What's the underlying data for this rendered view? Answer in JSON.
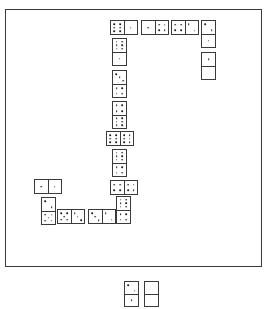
{
  "scene": {
    "title": "Domino chain layout",
    "board": {
      "x": 5,
      "y": 9,
      "width": 257,
      "height": 258
    }
  },
  "chart_data": {
    "type": "diagram",
    "tile_count_in_play": 16,
    "tile_count_off_board": 2,
    "board_tiles": [
      {
        "id": "t1",
        "values": [
          6,
          1
        ],
        "orientation": "horizontal",
        "x": 110,
        "y": 20,
        "w": 28,
        "h": 15
      },
      {
        "id": "t2",
        "values": [
          1,
          4
        ],
        "orientation": "horizontal",
        "x": 141,
        "y": 20,
        "w": 28,
        "h": 15
      },
      {
        "id": "t3",
        "values": [
          4,
          2
        ],
        "orientation": "horizontal",
        "x": 171,
        "y": 20,
        "w": 28,
        "h": 15
      },
      {
        "id": "t4",
        "values": [
          2,
          1
        ],
        "orientation": "vertical",
        "x": 201,
        "y": 20,
        "w": 15,
        "h": 28
      },
      {
        "id": "t5",
        "values": [
          1,
          0
        ],
        "orientation": "vertical",
        "x": 201,
        "y": 52,
        "w": 15,
        "h": 28
      },
      {
        "id": "t6",
        "values": [
          6,
          1
        ],
        "orientation": "vertical",
        "x": 112,
        "y": 38,
        "w": 15,
        "h": 28
      },
      {
        "id": "t7",
        "values": [
          3,
          4
        ],
        "orientation": "vertical",
        "x": 112,
        "y": 70,
        "w": 15,
        "h": 28
      },
      {
        "id": "t8",
        "values": [
          4,
          6
        ],
        "orientation": "vertical",
        "x": 112,
        "y": 101,
        "w": 15,
        "h": 28
      },
      {
        "id": "t9",
        "values": [
          6,
          6
        ],
        "orientation": "horizontal",
        "x": 106,
        "y": 131,
        "w": 28,
        "h": 15
      },
      {
        "id": "t10",
        "values": [
          6,
          4
        ],
        "orientation": "vertical",
        "x": 112,
        "y": 149,
        "w": 15,
        "h": 28
      },
      {
        "id": "t11",
        "values": [
          4,
          4
        ],
        "orientation": "horizontal",
        "x": 110,
        "y": 180,
        "w": 28,
        "h": 15
      },
      {
        "id": "t12",
        "values": [
          6,
          4
        ],
        "orientation": "vertical",
        "x": 116,
        "y": 196,
        "w": 15,
        "h": 28
      },
      {
        "id": "t13",
        "values": [
          1,
          1
        ],
        "orientation": "horizontal",
        "x": 34,
        "y": 179,
        "w": 28,
        "h": 15
      },
      {
        "id": "t14",
        "values": [
          2,
          5
        ],
        "orientation": "vertical",
        "x": 41,
        "y": 197,
        "w": 15,
        "h": 28
      },
      {
        "id": "t15",
        "values": [
          5,
          3
        ],
        "orientation": "horizontal",
        "x": 57,
        "y": 209,
        "w": 28,
        "h": 15
      },
      {
        "id": "t16",
        "values": [
          3,
          2
        ],
        "orientation": "horizontal",
        "x": 88,
        "y": 209,
        "w": 28,
        "h": 15
      }
    ],
    "offboard_tiles": [
      {
        "id": "h1",
        "values": [
          2,
          1
        ],
        "orientation": "vertical",
        "x": 124,
        "y": 281,
        "w": 15,
        "h": 26
      },
      {
        "id": "h2",
        "values": [
          0,
          0
        ],
        "orientation": "vertical",
        "x": 144,
        "y": 281,
        "w": 15,
        "h": 26
      }
    ]
  }
}
